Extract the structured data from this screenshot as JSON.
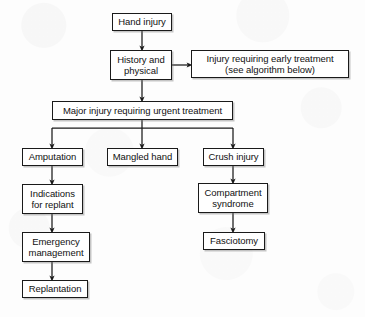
{
  "diagram": {
    "line_color": "#1a1a1a",
    "box_fill": "#ffffff",
    "background": "#fdfdfd",
    "nodes": [
      {
        "id": "hand-injury",
        "label": "Hand injury",
        "x": 112,
        "y": 13,
        "w": 60,
        "h": 18
      },
      {
        "id": "history-physical",
        "label": "History and\nphysical",
        "x": 110,
        "y": 50,
        "w": 62,
        "h": 30
      },
      {
        "id": "early-treatment",
        "label": "Injury requiring early treatment\n(see algorithm below)",
        "x": 191,
        "y": 50,
        "w": 158,
        "h": 28
      },
      {
        "id": "major-injury",
        "label": "Major injury requiring urgent treatment",
        "x": 52,
        "y": 101,
        "w": 181,
        "h": 19
      },
      {
        "id": "amputation",
        "label": "Amputation",
        "x": 22,
        "y": 148,
        "w": 61,
        "h": 18
      },
      {
        "id": "mangled-hand",
        "label": "Mangled hand",
        "x": 107,
        "y": 148,
        "w": 71,
        "h": 18
      },
      {
        "id": "crush-injury",
        "label": "Crush injury",
        "x": 203,
        "y": 148,
        "w": 61,
        "h": 18
      },
      {
        "id": "indications-replant",
        "label": "Indications\nfor replant",
        "x": 22,
        "y": 184,
        "w": 61,
        "h": 30
      },
      {
        "id": "compartment-syndrome",
        "label": "Compartment\nsyndrome",
        "x": 198,
        "y": 183,
        "w": 70,
        "h": 30
      },
      {
        "id": "emergency-management",
        "label": "Emergency\nmanagement",
        "x": 22,
        "y": 232,
        "w": 68,
        "h": 30
      },
      {
        "id": "fasciotomy",
        "label": "Fasciotomy",
        "x": 203,
        "y": 232,
        "w": 62,
        "h": 18
      },
      {
        "id": "replantation",
        "label": "Replantation",
        "x": 22,
        "y": 280,
        "w": 66,
        "h": 18
      }
    ],
    "edges": [
      {
        "id": "edge-hand-injury-to-history",
        "from": "hand-injury",
        "to": "history-physical",
        "kind": "vertical-arrow"
      },
      {
        "id": "edge-history-to-early-treatment",
        "from": "history-physical",
        "to": "early-treatment",
        "kind": "horizontal-arrow"
      },
      {
        "id": "edge-history-to-major-injury",
        "from": "history-physical",
        "to": "major-injury",
        "kind": "vertical-arrow"
      },
      {
        "id": "edge-major-injury-to-amputation",
        "from": "major-injury",
        "to": "amputation",
        "kind": "branch-arrow"
      },
      {
        "id": "edge-major-injury-to-mangled-hand",
        "from": "major-injury",
        "to": "mangled-hand",
        "kind": "branch-arrow"
      },
      {
        "id": "edge-major-injury-to-crush-injury",
        "from": "major-injury",
        "to": "crush-injury",
        "kind": "branch-arrow"
      },
      {
        "id": "edge-amputation-to-indications",
        "from": "amputation",
        "to": "indications-replant",
        "kind": "vertical-arrow"
      },
      {
        "id": "edge-indications-to-emergency",
        "from": "indications-replant",
        "to": "emergency-management",
        "kind": "vertical-arrow"
      },
      {
        "id": "edge-emergency-to-replantation",
        "from": "emergency-management",
        "to": "replantation",
        "kind": "vertical-arrow"
      },
      {
        "id": "edge-crush-to-compartment",
        "from": "crush-injury",
        "to": "compartment-syndrome",
        "kind": "vertical-arrow"
      },
      {
        "id": "edge-compartment-to-fasciotomy",
        "from": "compartment-syndrome",
        "to": "fasciotomy",
        "kind": "vertical-arrow"
      }
    ]
  }
}
